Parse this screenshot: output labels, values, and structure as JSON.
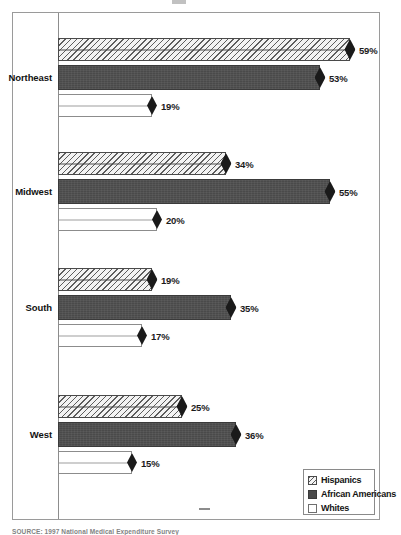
{
  "figure": {
    "source_note": "SOURCE: 1997 National Medical Expenditure Survey"
  },
  "legend": {
    "items": [
      {
        "label": "Hispanics",
        "swatch": "hatched-swatch",
        "color": "#f3f3f3"
      },
      {
        "label": "African Americans",
        "swatch": "solid-dark-swatch",
        "color": "#4a4a4a"
      },
      {
        "label": "Whites",
        "swatch": "open-white-swatch",
        "color": "#ffffff"
      }
    ]
  },
  "chart_data": {
    "type": "bar",
    "orientation": "horizontal",
    "title": "",
    "xlabel": "",
    "ylabel": "",
    "xlim": [
      0,
      62
    ],
    "grid": false,
    "legend_position": "bottom-right",
    "value_suffix": "%",
    "categories": [
      "Northeast",
      "Midwest",
      "South",
      "West"
    ],
    "series": [
      {
        "name": "Hispanics",
        "values": [
          59,
          34,
          19,
          25
        ]
      },
      {
        "name": "African Americans",
        "values": [
          53,
          55,
          35,
          36
        ]
      },
      {
        "name": "Whites",
        "values": [
          19,
          20,
          17,
          15
        ]
      }
    ],
    "labels": {
      "Northeast": [
        "59%",
        "53%",
        "19%"
      ],
      "Midwest": [
        "34%",
        "55%",
        "20%"
      ],
      "South": [
        "19%",
        "35%",
        "17%"
      ],
      "West": [
        "25%",
        "36%",
        "15%"
      ]
    }
  }
}
